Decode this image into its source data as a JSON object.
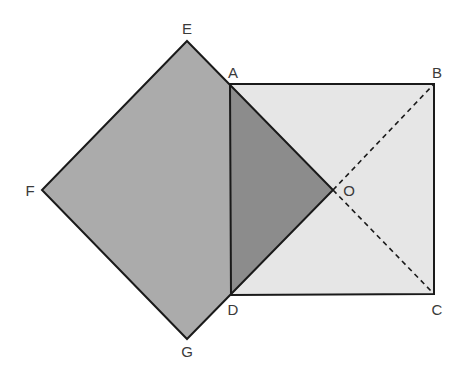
{
  "diagram": {
    "type": "geometry",
    "colors": {
      "rotated_square_fill": "#ababab",
      "overlap_triangle_fill": "#8c8c8c",
      "rectangle_fill": "#e6e6e6",
      "stroke": "#1a1a1a",
      "label": "#3a3a3a",
      "background": "#ffffff"
    },
    "points": {
      "A": {
        "label": "A",
        "x": 230,
        "y": 84,
        "lx": 233,
        "ly": 76
      },
      "B": {
        "label": "B",
        "x": 434,
        "y": 84,
        "lx": 437,
        "ly": 76
      },
      "C": {
        "label": "C",
        "x": 434,
        "y": 294,
        "lx": 437,
        "ly": 314
      },
      "D": {
        "label": "D",
        "x": 231,
        "y": 295,
        "lx": 233,
        "ly": 314
      },
      "E": {
        "label": "E",
        "x": 187,
        "y": 41,
        "lx": 187,
        "ly": 34
      },
      "F": {
        "label": "F",
        "x": 42,
        "y": 190,
        "lx": 30,
        "ly": 195
      },
      "G": {
        "label": "G",
        "x": 187,
        "y": 339,
        "lx": 187,
        "ly": 357
      },
      "O": {
        "label": "O",
        "x": 333,
        "y": 190,
        "lx": 349,
        "ly": 195
      }
    },
    "shapes": [
      {
        "name": "square-ABCD",
        "vertices": [
          "A",
          "B",
          "C",
          "D"
        ],
        "fill": "light"
      },
      {
        "name": "square-EOGF",
        "vertices": [
          "E",
          "O",
          "G",
          "F"
        ],
        "fill": "medium"
      },
      {
        "name": "triangle-AOD",
        "vertices": [
          "A",
          "O",
          "D"
        ],
        "fill": "dark"
      }
    ],
    "dashed_segments": [
      {
        "from": "O",
        "to": "B"
      },
      {
        "from": "O",
        "to": "C"
      }
    ]
  }
}
